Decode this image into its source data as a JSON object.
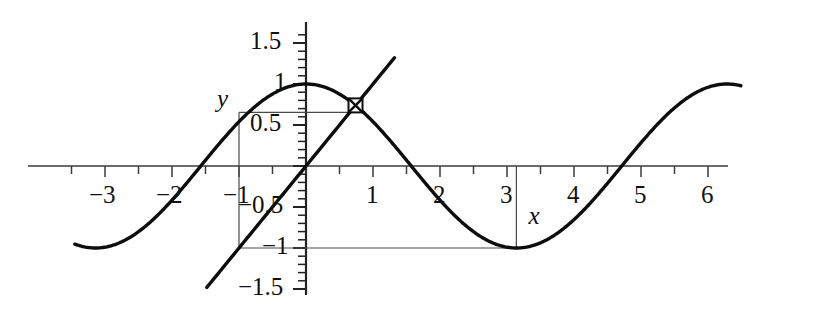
{
  "chart_data": {
    "type": "line",
    "title": "",
    "subtitle": "",
    "xlabel": "x",
    "ylabel": "y",
    "xlim": [
      -3.45,
      6.55
    ],
    "ylim": [
      -1.62,
      1.62
    ],
    "grid": false,
    "legend": "none",
    "x_ticks_major": [
      -3,
      -2,
      -1,
      1,
      2,
      3,
      4,
      5,
      6
    ],
    "x_tick_labels": [
      "−3",
      "−2",
      "−1",
      "1",
      "2",
      "3",
      "4",
      "5",
      "6"
    ],
    "x_tick_step_minor": 0.5,
    "y_ticks_major": [
      -1.5,
      -1,
      -0.5,
      0.5,
      1,
      1.5
    ],
    "y_tick_labels": [
      "−1.5",
      "−1",
      "−0.5",
      "0.5",
      "1",
      "1.5"
    ],
    "y_tick_step_minor": 0.1,
    "series": [
      {
        "name": "cosine",
        "type": "line",
        "expression": "cos(x)",
        "x_start": -3.45,
        "x_end": 6.5,
        "key_points": [
          {
            "x": -3.14,
            "y": -1.0
          },
          {
            "x": -1.57,
            "y": 0.0
          },
          {
            "x": 0.0,
            "y": 1.0
          },
          {
            "x": 1.57,
            "y": 0.0
          },
          {
            "x": 3.14,
            "y": -1.0
          },
          {
            "x": 4.71,
            "y": 0.0
          },
          {
            "x": 6.28,
            "y": 1.0
          }
        ]
      },
      {
        "name": "identity",
        "type": "line",
        "expression": "x",
        "x_start": -1.48,
        "x_end": 1.36,
        "key_points": [
          {
            "x": -1.48,
            "y": -1.48
          },
          {
            "x": 0.0,
            "y": 0.0
          },
          {
            "x": 1.36,
            "y": 1.36
          }
        ]
      }
    ],
    "annotations": [
      {
        "name": "intersection-marker",
        "shape": "square",
        "x": 0.739,
        "y": 0.739,
        "label": ""
      },
      {
        "name": "guide-horizontal-upper",
        "shape": "segment",
        "x0": -1.0,
        "y0": 0.6536,
        "x1": 0.739,
        "y1": 0.6536
      },
      {
        "name": "guide-vertical-left",
        "shape": "segment",
        "x0": -1.0,
        "y0": 0.6536,
        "x1": -1.0,
        "y1": -1.0
      },
      {
        "name": "guide-horizontal-lower",
        "shape": "segment",
        "x0": -1.0,
        "y0": -1.0,
        "x1": 3.14,
        "y1": -1.0
      },
      {
        "name": "guide-vertical-right",
        "shape": "segment",
        "x0": 3.14,
        "y0": 0.0,
        "x1": 3.14,
        "y1": -1.0
      }
    ]
  },
  "labels": {
    "x_axis_name": "x",
    "y_axis_name": "y",
    "x_ticks": [
      {
        "text": "−3",
        "value": -3
      },
      {
        "text": "−2",
        "value": -2
      },
      {
        "text": "−1",
        "value": -1
      },
      {
        "text": "1",
        "value": 1
      },
      {
        "text": "2",
        "value": 2
      },
      {
        "text": "3",
        "value": 3
      },
      {
        "text": "4",
        "value": 4
      },
      {
        "text": "5",
        "value": 5
      },
      {
        "text": "6",
        "value": 6
      }
    ],
    "y_ticks": [
      {
        "text": "1.5",
        "value": 1.5
      },
      {
        "text": "1",
        "value": 1
      },
      {
        "text": "0.5",
        "value": 0.5
      },
      {
        "text": "−0.5",
        "value": -0.5
      },
      {
        "text": "−1",
        "value": -1
      },
      {
        "text": "−1.5",
        "value": -1.5
      }
    ]
  }
}
